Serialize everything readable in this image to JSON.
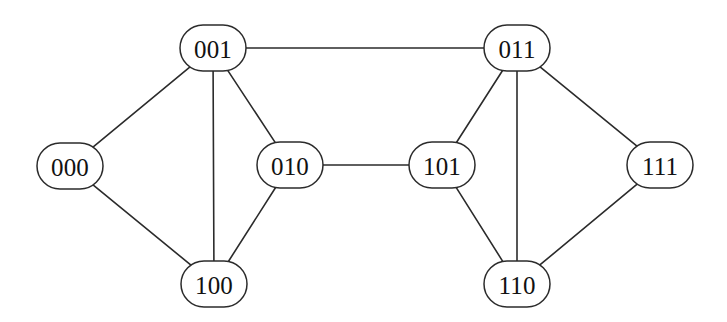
{
  "diagram": {
    "background_color": "#ffffff",
    "edge_color": "#2b2b2b",
    "node_fill": "#ffffff",
    "node_stroke": "#2b2b2b",
    "node_shape": "stadium",
    "width": 727,
    "height": 322,
    "node_width": 66,
    "node_height": 46,
    "nodes": [
      {
        "id": "000",
        "label": "000",
        "x": 70,
        "y": 166
      },
      {
        "id": "001",
        "label": "001",
        "x": 213,
        "y": 48
      },
      {
        "id": "010",
        "label": "010",
        "x": 290,
        "y": 165
      },
      {
        "id": "011",
        "label": "011",
        "x": 517,
        "y": 48
      },
      {
        "id": "100",
        "label": "100",
        "x": 214,
        "y": 284
      },
      {
        "id": "101",
        "label": "101",
        "x": 442,
        "y": 165
      },
      {
        "id": "110",
        "label": "110",
        "x": 517,
        "y": 284
      },
      {
        "id": "111",
        "label": "111",
        "x": 660,
        "y": 165
      }
    ],
    "edges": [
      {
        "source": "000",
        "target": "001"
      },
      {
        "source": "000",
        "target": "100"
      },
      {
        "source": "001",
        "target": "010"
      },
      {
        "source": "001",
        "target": "011"
      },
      {
        "source": "001",
        "target": "100"
      },
      {
        "source": "010",
        "target": "100"
      },
      {
        "source": "010",
        "target": "101"
      },
      {
        "source": "011",
        "target": "101"
      },
      {
        "source": "011",
        "target": "110"
      },
      {
        "source": "011",
        "target": "111"
      },
      {
        "source": "101",
        "target": "110"
      },
      {
        "source": "110",
        "target": "111"
      }
    ]
  }
}
